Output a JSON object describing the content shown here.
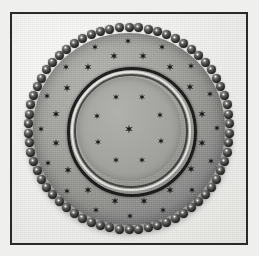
{
  "image": {
    "kind": "photograph",
    "palette": "black-and-white",
    "subject_name": "pressed-glass-plate",
    "caption": "",
    "background_color": "#efefed",
    "frame_color": "#2a2a2a",
    "plate_color": "#9a9a97",
    "bead_color": "#111111",
    "star_color": "#1b1b1a",
    "highlight_color": "#f6f6f3"
  },
  "frame": {
    "left": 10,
    "top": 12,
    "width": 238,
    "height": 233,
    "border_width": 2
  },
  "plate": {
    "center_x": 128,
    "center_y": 127,
    "outer_radius": 96,
    "bead_ring_radius": 101,
    "bead_count": 66,
    "bead_size": 9,
    "ring_radius": 62,
    "well_radius": 52
  },
  "stars": {
    "center_star": {
      "x": 0,
      "y": 0,
      "size": 9
    },
    "well_ring": {
      "count": 8,
      "radius": 34,
      "size": 7,
      "angle_offset": 22
    },
    "band_ring_inner": {
      "count": 16,
      "radius": 74,
      "size": 8,
      "angle_offset": 11
    },
    "band_ring_outer": {
      "count": 16,
      "radius": 88,
      "size": 7,
      "angle_offset": 22
    }
  }
}
